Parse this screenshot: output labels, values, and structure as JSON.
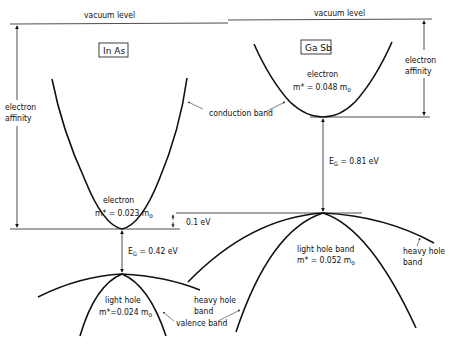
{
  "diagram": {
    "vacuum_level_left": "vacuum level",
    "vacuum_level_right": "vacuum level",
    "materials": {
      "inas": {
        "name": "In As",
        "electron_affinity_label_1": "electron",
        "electron_affinity_label_2": "affinity",
        "electron_label": "electron",
        "electron_mass": "m* = 0.023 m",
        "electron_mass_sub": "o",
        "bandgap_prefix": "E",
        "bandgap_sub": "G",
        "bandgap_value": " = 0.42  eV",
        "light_hole_label": "light hole",
        "light_hole_mass": "m*=0.024 m",
        "light_hole_mass_sub": "o",
        "heavy_hole_label_1": "heavy hole",
        "heavy_hole_label_2": "band",
        "valence_band_label": "valence band"
      },
      "gasb": {
        "name": "Ga Sb",
        "electron_affinity_label_1": "electron",
        "electron_affinity_label_2": "affinity",
        "electron_label": "electron",
        "electron_mass": "m* = 0.048  m",
        "electron_mass_sub": "o",
        "bandgap_prefix": "E",
        "bandgap_sub": "G",
        "bandgap_value": " = 0.81  eV",
        "light_hole_label": "light hole band",
        "light_hole_mass": "m* = 0.052  m",
        "light_hole_mass_sub": "o",
        "heavy_hole_label_1": "heavy  hole",
        "heavy_hole_label_2": "band"
      }
    },
    "conduction_band_label": "conduction band",
    "offset_label": "0.1  eV",
    "colors": {
      "ink": "#111111",
      "background": "#ffffff"
    }
  }
}
